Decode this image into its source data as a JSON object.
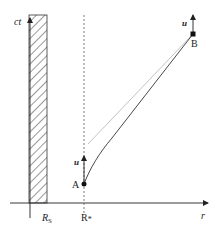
{
  "diagram": {
    "axes": {
      "vertical_label": "ct",
      "horizontal_label": "r"
    },
    "markers": {
      "rs_label": "R",
      "rs_subscript": "S",
      "rstar_label": "R",
      "rstar_subscript": "*"
    },
    "points": {
      "a_label": "A",
      "b_label": "B"
    },
    "vectors": {
      "a_vector_label": "u",
      "b_vector_label": "u"
    },
    "colors": {
      "line": "#222222",
      "faint_line": "#bbbbbb",
      "hatch": "#333333"
    }
  }
}
